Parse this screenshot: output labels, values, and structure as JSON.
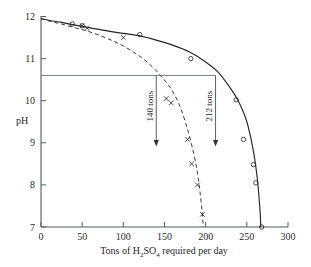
{
  "chart_data": {
    "type": "line",
    "title": "",
    "xlabel": "Tons of H2SO4 required per day",
    "xlabel_parts": {
      "pre": "Tons of H",
      "sub1": "2",
      "mid": "SO",
      "sub2": "4",
      "post": " required per day"
    },
    "ylabel": "pH",
    "xlim": [
      0,
      300
    ],
    "ylim": [
      7,
      12
    ],
    "xticks": [
      0,
      50,
      100,
      150,
      200,
      250,
      300
    ],
    "yticks": [
      7,
      8,
      9,
      10,
      11,
      12
    ],
    "grid": false,
    "legend": "none",
    "series": [
      {
        "name": "solid-curve",
        "style": "solid",
        "marker": "circle",
        "x": [
          0,
          12,
          25,
          40,
          60,
          80,
          100,
          120,
          140,
          160,
          180,
          200,
          215,
          230,
          240,
          250,
          258,
          263,
          266,
          267
        ],
        "y": [
          11.95,
          11.9,
          11.86,
          11.8,
          11.73,
          11.66,
          11.6,
          11.54,
          11.44,
          11.32,
          11.16,
          10.92,
          10.68,
          10.3,
          9.98,
          9.5,
          8.8,
          8.1,
          7.4,
          7.0
        ],
        "points_x": [
          38,
          50,
          120,
          182,
          237,
          246,
          258,
          261,
          268
        ],
        "points_y": [
          11.82,
          11.78,
          11.57,
          11.0,
          10.02,
          9.08,
          8.48,
          8.05,
          7.0
        ]
      },
      {
        "name": "dashed-curve",
        "style": "dashed",
        "marker": "x",
        "x": [
          0,
          12,
          25,
          40,
          55,
          70,
          85,
          100,
          115,
          130,
          145,
          158,
          168,
          176,
          183,
          189,
          193,
          196,
          197
        ],
        "y": [
          11.95,
          11.88,
          11.82,
          11.74,
          11.66,
          11.56,
          11.44,
          11.3,
          11.12,
          10.9,
          10.6,
          10.28,
          9.9,
          9.45,
          8.95,
          8.4,
          7.85,
          7.3,
          7.0
        ],
        "points_x": [
          50,
          56,
          100,
          152,
          158,
          178,
          183,
          190,
          196
        ],
        "points_y": [
          11.78,
          11.72,
          11.5,
          10.05,
          9.95,
          9.08,
          8.5,
          8.0,
          7.3
        ]
      }
    ],
    "reference_line": {
      "name": "ph-reference-line",
      "y": 10.6,
      "x_from": 0,
      "x_to": 212
    },
    "annotations": [
      {
        "name": "annotation-140-tons",
        "label": "140 tons",
        "x": 140,
        "y_top": 10.6,
        "y_bottom": 8.95
      },
      {
        "name": "annotation-212-tons",
        "label": "212 tons",
        "x": 212,
        "y_top": 10.6,
        "y_bottom": 8.95
      }
    ]
  }
}
